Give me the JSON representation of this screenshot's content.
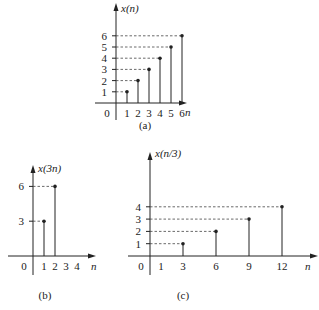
{
  "chart_data": [
    {
      "type": "stem",
      "title": "(a)",
      "ylabel": "x(n)",
      "xlabel": "n",
      "x": [
        1,
        2,
        3,
        4,
        5,
        6
      ],
      "values": [
        1,
        2,
        3,
        4,
        5,
        6
      ],
      "xticks": [
        "0",
        "1",
        "2",
        "3",
        "4",
        "5",
        "6"
      ],
      "yticks": [
        "1",
        "2",
        "3",
        "4",
        "5",
        "6"
      ],
      "dashed_guides": true
    },
    {
      "type": "stem",
      "title": "(b)",
      "ylabel": "x(3n)",
      "xlabel": "n",
      "x": [
        1,
        2
      ],
      "values": [
        3,
        6
      ],
      "xticks": [
        "0",
        "1",
        "2",
        "3",
        "4"
      ],
      "yticks": [
        "3",
        "6"
      ],
      "dashed_guides": true
    },
    {
      "type": "stem",
      "title": "(c)",
      "ylabel": "x(n/3)",
      "xlabel": "n",
      "x": [
        3,
        6,
        9,
        12
      ],
      "values": [
        1,
        2,
        3,
        4
      ],
      "xticks": [
        "0",
        "1",
        "3",
        "6",
        "9",
        "12"
      ],
      "yticks": [
        "1",
        "2",
        "3",
        "4"
      ],
      "dashed_guides": true
    }
  ],
  "captions": {
    "a": "(a)",
    "b": "(b)",
    "c": "(c)"
  },
  "labels": {
    "a_y": "x(n)",
    "b_y": "x(3n)",
    "c_y": "x(n/3)",
    "n": "n"
  }
}
